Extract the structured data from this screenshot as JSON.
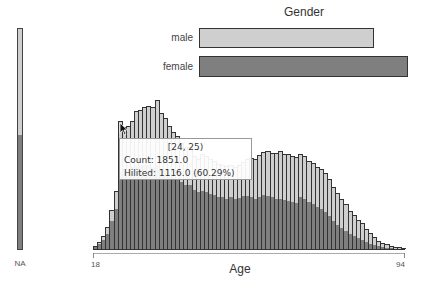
{
  "chart_data": [
    {
      "type": "bar",
      "title": "Gender",
      "orientation": "horizontal",
      "categories": [
        "male",
        "female"
      ],
      "values": [
        174,
        209
      ],
      "value_note": "relative bar lengths in px (female longest)",
      "colors": {
        "male": "#cfcfcf",
        "female": "#7f7f7f"
      }
    },
    {
      "type": "bar",
      "title": "NA",
      "categories": [
        "NA"
      ],
      "highlighted_fraction": 0.51,
      "colors": {
        "total": "#cfcfcf",
        "hilited": "#7f7f7f"
      }
    },
    {
      "type": "bar",
      "title": "",
      "xlabel": "Age",
      "ylabel": "",
      "xlim": [
        18,
        94
      ],
      "x_tick_labels": [
        "18",
        "94"
      ],
      "bin_width": 1,
      "categories": [
        18,
        19,
        20,
        21,
        22,
        23,
        24,
        25,
        26,
        27,
        28,
        29,
        30,
        31,
        32,
        33,
        34,
        35,
        36,
        37,
        38,
        39,
        40,
        41,
        42,
        43,
        44,
        45,
        46,
        47,
        48,
        49,
        50,
        51,
        52,
        53,
        54,
        55,
        56,
        57,
        58,
        59,
        60,
        61,
        62,
        63,
        64,
        65,
        66,
        67,
        68,
        69,
        70,
        71,
        72,
        73,
        74,
        75,
        76,
        77,
        78,
        79,
        80,
        81,
        82,
        83,
        84,
        85,
        86,
        87,
        88,
        89,
        90,
        91,
        92,
        93
      ],
      "series": [
        {
          "name": "Count",
          "values": [
            43,
            101,
            188,
            318,
            564,
            839,
            1851,
            1764,
            1779,
            1851,
            1996,
            2010,
            2054,
            2068,
            2054,
            2155,
            1967,
            1894,
            1779,
            1692,
            1634,
            1533,
            1475,
            1475,
            1345,
            1301,
            1374,
            1345,
            1301,
            1272,
            1229,
            1215,
            1200,
            1215,
            1186,
            1215,
            1258,
            1301,
            1316,
            1301,
            1359,
            1403,
            1417,
            1388,
            1388,
            1417,
            1374,
            1374,
            1345,
            1330,
            1374,
            1345,
            1272,
            1244,
            1186,
            1157,
            1099,
            1012,
            896,
            810,
            723,
            651,
            549,
            492,
            419,
            376,
            289,
            231,
            174,
            116,
            87,
            72,
            43,
            29,
            29,
            14
          ]
        },
        {
          "name": "Hilited",
          "values": [
            29,
            72,
            130,
            217,
            405,
            578,
            1116,
            1157,
            1157,
            1186,
            1200,
            1200,
            1215,
            1215,
            1186,
            1215,
            1157,
            1128,
            1070,
            1041,
            1012,
            969,
            925,
            925,
            853,
            824,
            838,
            824,
            795,
            781,
            752,
            752,
            723,
            752,
            723,
            738,
            766,
            766,
            752,
            723,
            752,
            781,
            766,
            752,
            723,
            723,
            709,
            695,
            680,
            666,
            752,
            723,
            680,
            651,
            608,
            579,
            535,
            477,
            405,
            347,
            304,
            260,
            217,
            188,
            159,
            130,
            101,
            72,
            58,
            43,
            29,
            14,
            14,
            7,
            7,
            0
          ]
        }
      ],
      "tooltip": {
        "range": "[24, 25)",
        "count": "1851.0",
        "hilited": "1116.0",
        "hilited_pct": "60.29%"
      },
      "colors": {
        "total": "#cfcfcf",
        "hilited": "#7f7f7f"
      }
    }
  ],
  "gender": {
    "title": "Gender",
    "male_label": "male",
    "female_label": "female",
    "male_color": "#cfcfcf",
    "female_color": "#7f7f7f"
  },
  "na": {
    "label": "NA"
  },
  "age": {
    "xlabel": "Age",
    "min_label": "18",
    "max_label": "94"
  },
  "tooltip": {
    "range": "[24, 25)",
    "count_line": "Count: 1851.0",
    "hilited_line": "Hilited: 1116.0 (60.29%)"
  }
}
